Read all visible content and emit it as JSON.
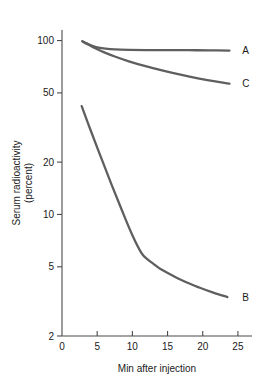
{
  "chart_data": {
    "type": "line",
    "title": "",
    "xlabel": "Min after injection",
    "ylabel": "Serum radioactivity (percent)",
    "ylabel_line1": "Serum radioactivity",
    "ylabel_line2": "(percent)",
    "xscale": "linear",
    "yscale": "log",
    "xlim": [
      0,
      27
    ],
    "ylim": [
      2,
      115
    ],
    "grid": false,
    "legend_position": "inline-right-of-curve-ends",
    "xticks": [
      0,
      5,
      10,
      15,
      20,
      25
    ],
    "xtick_labels": [
      "0",
      "5",
      "10",
      "15",
      "20",
      "25"
    ],
    "yticks": [
      2,
      5,
      10,
      20,
      50,
      100
    ],
    "ytick_labels": [
      "2",
      "5",
      "10",
      "20",
      "50",
      "100"
    ],
    "series": [
      {
        "name": "A",
        "label": "A",
        "color": "#5f5f5f",
        "x": [
          2.9,
          3.6,
          4.4,
          5.2,
          6.2,
          7.5,
          9.5,
          12.0,
          15.0,
          18.0,
          21.0,
          23.8
        ],
        "y": [
          99.0,
          96.0,
          93.0,
          91.0,
          89.8,
          89.0,
          88.5,
          88.2,
          88.0,
          88.0,
          87.8,
          87.6
        ]
      },
      {
        "name": "C",
        "label": "C",
        "color": "#5f5f5f",
        "x": [
          2.9,
          3.8,
          4.8,
          6.0,
          7.5,
          9.5,
          12.0,
          14.5,
          17.0,
          19.5,
          22.0,
          23.8
        ],
        "y": [
          99.0,
          94.5,
          90.0,
          85.5,
          81.0,
          76.0,
          71.0,
          67.0,
          63.5,
          60.5,
          58.0,
          56.5
        ]
      },
      {
        "name": "B",
        "label": "B",
        "color": "#5f5f5f",
        "x": [
          2.8,
          4.0,
          5.5,
          7.0,
          8.5,
          10.0,
          11.3,
          12.2,
          13.0,
          14.0,
          15.5,
          17.5,
          19.5,
          21.5,
          23.5
        ],
        "y": [
          42.0,
          31.0,
          21.5,
          15.0,
          10.6,
          7.6,
          6.0,
          5.5,
          5.2,
          4.85,
          4.5,
          4.1,
          3.8,
          3.55,
          3.35
        ]
      }
    ],
    "annotations": [
      {
        "text": "A",
        "x": 25.6,
        "y": 87.6
      },
      {
        "text": "C",
        "x": 25.6,
        "y": 56.5
      },
      {
        "text": "B",
        "x": 25.6,
        "y": 3.35
      }
    ],
    "colors": {
      "curve": "#5f5f5f",
      "axis": "#4a4a4a",
      "text": "#1a1a1a",
      "background": "#ffffff"
    }
  }
}
